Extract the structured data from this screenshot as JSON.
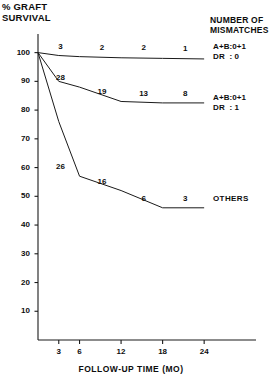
{
  "chart_data": {
    "type": "line",
    "title": "",
    "ylabel": "% GRAFT\nSURVIVAL",
    "xlabel": "FOLLOW-UP TIME (MO)",
    "x": [
      0,
      3,
      6,
      12,
      18,
      24
    ],
    "xlim": [
      0,
      26
    ],
    "ylim": [
      0,
      103
    ],
    "xticks": [
      "3",
      "6",
      "12",
      "18",
      "24"
    ],
    "xtick_values": [
      3,
      6,
      12,
      18,
      24
    ],
    "yticks": [
      "10",
      "20",
      "30",
      "40",
      "50",
      "60",
      "70",
      "80",
      "90",
      "100"
    ],
    "ytick_values": [
      10,
      20,
      30,
      40,
      50,
      60,
      70,
      80,
      90,
      100
    ],
    "grid": false,
    "legend_position": "right",
    "legend_title": "NUMBER OF\nMISMATCHES",
    "series": [
      {
        "name": "A+B:0+1  DR : 0",
        "legend_label": "A+B:0+1\nDR  : 0",
        "x": [
          0,
          3,
          6,
          12,
          18,
          24
        ],
        "values": [
          100,
          99,
          98.6,
          98.2,
          98,
          97.8
        ],
        "point_labels": [
          {
            "x": 6,
            "value": 98.6,
            "label": "3"
          },
          {
            "x": 12,
            "value": 98.2,
            "label": "2"
          },
          {
            "x": 18,
            "value": 98,
            "label": "2"
          },
          {
            "x": 24,
            "value": 97.8,
            "label": "1"
          }
        ]
      },
      {
        "name": "A+B:0+1  DR : 1",
        "legend_label": "A+B:0+1\nDR  : 1",
        "x": [
          0,
          3,
          6,
          12,
          18,
          24
        ],
        "values": [
          100,
          90,
          88,
          83,
          82.5,
          82.5
        ],
        "point_labels": [
          {
            "x": 6,
            "value": 88,
            "label": "28"
          },
          {
            "x": 12,
            "value": 83,
            "label": "19"
          },
          {
            "x": 18,
            "value": 82.5,
            "label": "13"
          },
          {
            "x": 24,
            "value": 82.5,
            "label": "8"
          }
        ]
      },
      {
        "name": "OTHERS",
        "legend_label": "OTHERS",
        "x": [
          0,
          3,
          6,
          12,
          18,
          24
        ],
        "values": [
          100,
          76,
          57,
          52,
          46,
          46
        ],
        "point_labels": [
          {
            "x": 6,
            "value": 57,
            "label": "26"
          },
          {
            "x": 12,
            "value": 52,
            "label": "16"
          },
          {
            "x": 18,
            "value": 46,
            "label": "6"
          },
          {
            "x": 24,
            "value": 46,
            "label": "3"
          }
        ]
      }
    ]
  },
  "axes": {
    "y_title": "% GRAFT\nSURVIVAL",
    "x_title": "FOLLOW-UP TIME (MO)"
  },
  "legend": {
    "title": "NUMBER OF\nMISMATCHES",
    "entries": [
      {
        "label": "A+B:0+1\nDR  : 0"
      },
      {
        "label": "A+B:0+1\nDR  : 1"
      },
      {
        "label": "OTHERS"
      }
    ]
  }
}
